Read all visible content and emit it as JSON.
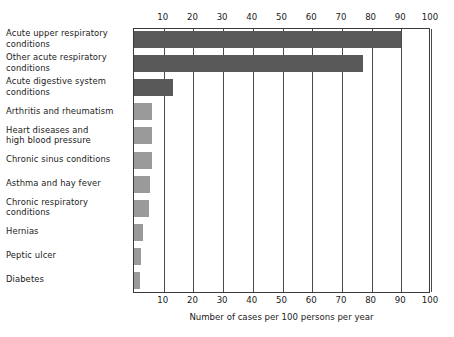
{
  "chart_data": {
    "type": "bar",
    "orientation": "horizontal",
    "title": "",
    "xlabel": "Number of cases per 100 persons per year",
    "ylabel": "",
    "xlim": [
      0,
      100
    ],
    "xticks": [
      10,
      20,
      30,
      40,
      50,
      60,
      70,
      80,
      90,
      100
    ],
    "grid": true,
    "axis_positions": [
      "top",
      "bottom"
    ],
    "legend": null,
    "categories": [
      "Acute upper respiratory\nconditions",
      "Other acute respiratory\nconditions",
      "Acute digestive system\nconditions",
      "Arthritis and rheumatism",
      "Heart diseases and\nhigh blood pressure",
      "Chronic sinus conditions",
      "Asthma and hay fever",
      "Chronic respiratory\nconditions",
      "Hernias",
      "Peptic ulcer",
      "Diabetes"
    ],
    "values": [
      90,
      77,
      13,
      6,
      6,
      6,
      5.5,
      5,
      3,
      2.5,
      2
    ],
    "bar_colors": [
      "#595959",
      "#595959",
      "#595959",
      "#9a9a9a",
      "#9a9a9a",
      "#9a9a9a",
      "#9a9a9a",
      "#9a9a9a",
      "#9a9a9a",
      "#9a9a9a",
      "#9a9a9a"
    ]
  },
  "colors": {
    "dark_bar": "#595959",
    "light_bar": "#9a9a9a",
    "axis": "#3a3a3a",
    "grid": "#4a4a4a",
    "background": "#ffffff",
    "text": "#1a1a1a"
  }
}
